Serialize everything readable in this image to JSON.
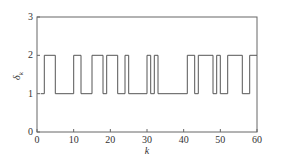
{
  "chart_data": {
    "type": "line",
    "step": true,
    "title": "",
    "xlabel": "k",
    "ylabel": "δ",
    "ylabel_subscript": "k",
    "xlim": [
      0,
      60
    ],
    "ylim": [
      0,
      3
    ],
    "xticks": [
      0,
      10,
      20,
      30,
      40,
      50,
      60
    ],
    "yticks": [
      0,
      1,
      2,
      3
    ],
    "grid": false,
    "legend": null,
    "series": [
      {
        "name": "delta_k",
        "color": "#555555",
        "steps": [
          {
            "k_start": 1,
            "k_end": 2,
            "value": 1
          },
          {
            "k_start": 2,
            "k_end": 5,
            "value": 2
          },
          {
            "k_start": 5,
            "k_end": 10,
            "value": 1
          },
          {
            "k_start": 10,
            "k_end": 12,
            "value": 2
          },
          {
            "k_start": 12,
            "k_end": 15,
            "value": 1
          },
          {
            "k_start": 15,
            "k_end": 18,
            "value": 2
          },
          {
            "k_start": 18,
            "k_end": 19,
            "value": 1
          },
          {
            "k_start": 19,
            "k_end": 22,
            "value": 2
          },
          {
            "k_start": 22,
            "k_end": 24,
            "value": 1
          },
          {
            "k_start": 24,
            "k_end": 25,
            "value": 2
          },
          {
            "k_start": 25,
            "k_end": 30,
            "value": 1
          },
          {
            "k_start": 30,
            "k_end": 31,
            "value": 2
          },
          {
            "k_start": 31,
            "k_end": 32,
            "value": 1
          },
          {
            "k_start": 32,
            "k_end": 33,
            "value": 2
          },
          {
            "k_start": 33,
            "k_end": 41,
            "value": 1
          },
          {
            "k_start": 41,
            "k_end": 43,
            "value": 2
          },
          {
            "k_start": 43,
            "k_end": 44,
            "value": 1
          },
          {
            "k_start": 44,
            "k_end": 48,
            "value": 2
          },
          {
            "k_start": 48,
            "k_end": 49,
            "value": 1
          },
          {
            "k_start": 49,
            "k_end": 50,
            "value": 2
          },
          {
            "k_start": 50,
            "k_end": 52,
            "value": 1
          },
          {
            "k_start": 52,
            "k_end": 56,
            "value": 2
          },
          {
            "k_start": 56,
            "k_end": 58,
            "value": 1
          },
          {
            "k_start": 58,
            "k_end": 60,
            "value": 2
          }
        ]
      }
    ]
  }
}
